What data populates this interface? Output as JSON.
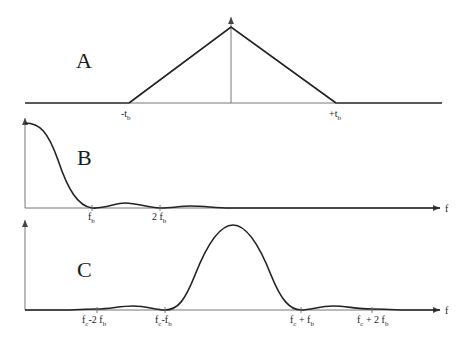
{
  "panels": {
    "a": {
      "label": "A",
      "ticks": [
        {
          "main": "-t",
          "sub": "b"
        },
        {
          "main": "+t",
          "sub": "b"
        }
      ]
    },
    "b": {
      "label": "B",
      "axis_label": "f",
      "ticks": [
        {
          "main": "f",
          "sub": "b"
        },
        {
          "main": "2 f",
          "sub": "b"
        }
      ]
    },
    "c": {
      "label": "C",
      "axis_label": "f",
      "ticks": [
        {
          "main": "f",
          "sub": "c",
          "rest": "-2 f",
          "sub2": "b"
        },
        {
          "main": "f",
          "sub": "c",
          "rest": "-f",
          "sub2": "b"
        },
        {
          "main": "f",
          "sub": "c",
          "rest": " + f",
          "sub2": "b"
        },
        {
          "main": "f",
          "sub": "c",
          "rest": " + 2 f",
          "sub2": "b"
        }
      ]
    }
  },
  "colors": {
    "line": "#222222",
    "axis": "#555555",
    "background": "#ffffff"
  }
}
